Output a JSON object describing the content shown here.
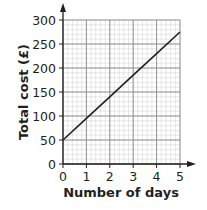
{
  "chart_data": {
    "type": "line",
    "title": "",
    "xlabel": "Number of days",
    "ylabel": "Total cost (£)",
    "x": [
      0,
      1,
      2,
      3,
      4,
      5
    ],
    "series": [
      {
        "name": "Total cost",
        "values": [
          50,
          95,
          140,
          185,
          230,
          275
        ]
      }
    ],
    "x_ticks": [
      "0",
      "1",
      "2",
      "3",
      "4",
      "5"
    ],
    "y_ticks": [
      "0",
      "50",
      "100",
      "150",
      "200",
      "250",
      "300"
    ],
    "xlim": [
      0,
      5
    ],
    "ylim": [
      0,
      300
    ],
    "grid": true,
    "minor_grid": {
      "x_step": 0.2,
      "y_step": 10
    },
    "legend": "none",
    "colors": {
      "line": "#231f20",
      "major_grid": "#8a8a8a",
      "minor_grid": "#cfcfcf",
      "axis": "#231f20"
    }
  }
}
